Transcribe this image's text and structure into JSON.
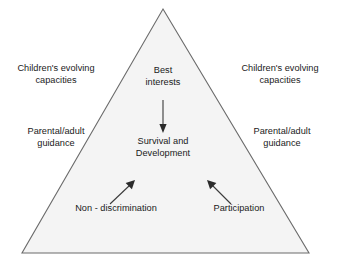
{
  "diagram": {
    "shape": {
      "name": "triangle",
      "apex": [
        163,
        9
      ],
      "bottom_left": [
        22,
        253
      ],
      "bottom_right": [
        309,
        253
      ],
      "fill_color": "#f4f4f4",
      "stroke_color": "#6b6b6b"
    },
    "labels": {
      "left_top": "Children's evolving\ncapacities",
      "left_mid": "Parental/adult\nguidance",
      "right_top": "Children's evolving\ncapacities",
      "right_mid": "Parental/adult\nguidance",
      "apex": "Best\ninterests",
      "core": "Survival and\nDevelopment",
      "bottom_left": "Non - discrimination",
      "bottom_right": "Participation"
    },
    "arrows": [
      {
        "name": "arrow-best-interests-to-survival",
        "from": [
          163,
          100
        ],
        "to": [
          163,
          131
        ],
        "direction": "down"
      },
      {
        "name": "arrow-non-discrimination-to-core",
        "from": [
          110,
          204
        ],
        "to": [
          133,
          182
        ],
        "direction": "up-right"
      },
      {
        "name": "arrow-participation-to-core",
        "from": [
          231,
          204
        ],
        "to": [
          209,
          182
        ],
        "direction": "up-left"
      }
    ],
    "arrow_color": "#333333",
    "text_color": "#1a1a1a"
  }
}
